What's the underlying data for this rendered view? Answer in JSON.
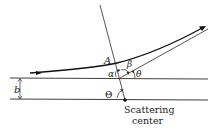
{
  "diagram": {
    "type": "scattering-geometry",
    "labels": {
      "point_A": "A",
      "alpha": "α",
      "beta": "β",
      "theta": "θ",
      "Theta": "Θ",
      "impact_parameter": "b",
      "scattering_center_line1": "Scattering",
      "scattering_center_line2": "center"
    },
    "colors": {
      "line": "#2a2a2a",
      "trajectory": "#111111",
      "background": "#ffffff"
    }
  }
}
